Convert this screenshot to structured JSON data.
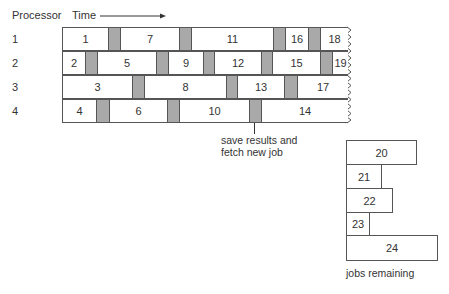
{
  "header": {
    "processor_label": "Processor",
    "time_label": "Time"
  },
  "rows": [
    {
      "label": "1",
      "top": 27,
      "jobs": [
        {
          "id": "1",
          "x": 62,
          "w": 46
        },
        {
          "id": "7",
          "x": 120,
          "w": 59
        },
        {
          "id": "11",
          "x": 191,
          "w": 82
        },
        {
          "id": "16",
          "x": 285,
          "w": 23
        },
        {
          "id": "18",
          "x": 320,
          "w": 27
        }
      ],
      "gaps": [
        [
          108,
          12
        ],
        [
          179,
          12
        ],
        [
          273,
          12
        ],
        [
          308,
          12
        ]
      ]
    },
    {
      "label": "2",
      "top": 51,
      "jobs": [
        {
          "id": "2",
          "x": 62,
          "w": 23
        },
        {
          "id": "5",
          "x": 97,
          "w": 59
        },
        {
          "id": "9",
          "x": 168,
          "w": 35
        },
        {
          "id": "12",
          "x": 214,
          "w": 47
        },
        {
          "id": "15",
          "x": 272,
          "w": 48
        },
        {
          "id": "19",
          "x": 332,
          "w": 15
        }
      ],
      "gaps": [
        [
          85,
          12
        ],
        [
          156,
          12
        ],
        [
          203,
          11
        ],
        [
          261,
          11
        ],
        [
          320,
          12
        ]
      ]
    },
    {
      "label": "3",
      "top": 75,
      "jobs": [
        {
          "id": "3",
          "x": 62,
          "w": 70
        },
        {
          "id": "8",
          "x": 144,
          "w": 82
        },
        {
          "id": "13",
          "x": 237,
          "w": 47
        },
        {
          "id": "17",
          "x": 297,
          "w": 50
        }
      ],
      "gaps": [
        [
          132,
          12
        ],
        [
          226,
          11
        ],
        [
          284,
          13
        ]
      ]
    },
    {
      "label": "4",
      "top": 99,
      "jobs": [
        {
          "id": "4",
          "x": 62,
          "w": 34
        },
        {
          "id": "6",
          "x": 109,
          "w": 58
        },
        {
          "id": "10",
          "x": 179,
          "w": 70
        },
        {
          "id": "14",
          "x": 261,
          "w": 86
        }
      ],
      "gaps": [
        [
          96,
          13
        ],
        [
          167,
          12
        ],
        [
          249,
          12
        ]
      ]
    }
  ],
  "annotation": {
    "line1": "save results and",
    "line2": "fetch new job"
  },
  "queue": {
    "caption": "jobs remaining",
    "jobs": [
      {
        "id": "20",
        "y": 140,
        "w": 70
      },
      {
        "id": "21",
        "y": 164,
        "w": 35
      },
      {
        "id": "22",
        "y": 188,
        "w": 46
      },
      {
        "id": "23",
        "y": 212,
        "w": 23
      },
      {
        "id": "24",
        "y": 235,
        "w": 91
      }
    ]
  },
  "colors": {
    "gap_fill": "#a9a9a9",
    "border": "#555555"
  }
}
